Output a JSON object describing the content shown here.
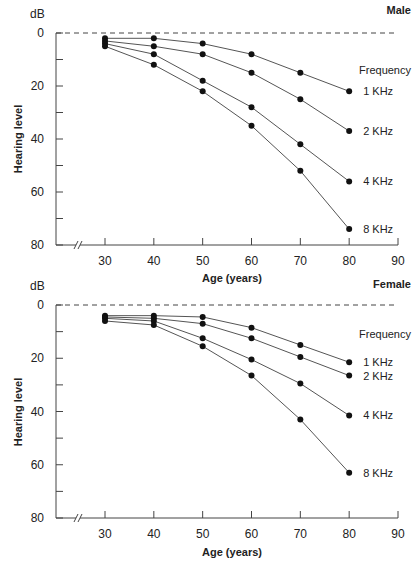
{
  "chart_data": [
    {
      "type": "line",
      "title": "Male",
      "unit_label": "dB",
      "xlabel": "Age (years)",
      "ylabel": "Hearing level",
      "legend_title": "Frequency",
      "x": [
        30,
        40,
        50,
        60,
        70,
        80
      ],
      "x_ticks": [
        30,
        40,
        50,
        60,
        70,
        80,
        90
      ],
      "y_ticks": [
        0,
        20,
        40,
        60,
        80
      ],
      "y_minor_ticks": [
        10,
        30,
        50,
        70
      ],
      "xlim": [
        20,
        90
      ],
      "ylim": [
        0,
        80
      ],
      "y_inverted": true,
      "axis_break": true,
      "reference_line": {
        "y": 0,
        "style": "dashed"
      },
      "series": [
        {
          "name": "1 KHz",
          "values": [
            2,
            2,
            4,
            8,
            15,
            22
          ]
        },
        {
          "name": "2 KHz",
          "values": [
            3,
            5,
            8,
            15,
            25,
            37
          ]
        },
        {
          "name": "4 KHz",
          "values": [
            4,
            8,
            18,
            28,
            42,
            56
          ]
        },
        {
          "name": "8 KHz",
          "values": [
            5,
            12,
            22,
            35,
            52,
            74
          ]
        }
      ]
    },
    {
      "type": "line",
      "title": "Female",
      "unit_label": "dB",
      "xlabel": "Age (years)",
      "ylabel": "Hearing level",
      "legend_title": "Frequency",
      "x": [
        30,
        40,
        50,
        60,
        70,
        80
      ],
      "x_ticks": [
        30,
        40,
        50,
        60,
        70,
        80,
        90
      ],
      "y_ticks": [
        0,
        20,
        40,
        60,
        80
      ],
      "y_minor_ticks": [
        10,
        30,
        50,
        70
      ],
      "xlim": [
        20,
        90
      ],
      "ylim": [
        0,
        80
      ],
      "y_inverted": true,
      "axis_break": true,
      "reference_line": {
        "y": 0,
        "style": "dashed"
      },
      "series": [
        {
          "name": "1 KHz",
          "values": [
            4,
            4,
            4.5,
            8.5,
            15,
            21.5
          ]
        },
        {
          "name": "2 KHz",
          "values": [
            4.5,
            5,
            7,
            12.5,
            19.5,
            26.5
          ]
        },
        {
          "name": "4 KHz",
          "values": [
            5,
            6,
            12.5,
            20.5,
            29.5,
            41.5
          ]
        },
        {
          "name": "8 KHz",
          "values": [
            6,
            7.5,
            15.5,
            26.5,
            43,
            63
          ]
        }
      ]
    }
  ],
  "colors": {
    "line": "#555555",
    "marker": "#111111",
    "axis": "#444444",
    "text": "#222222"
  }
}
